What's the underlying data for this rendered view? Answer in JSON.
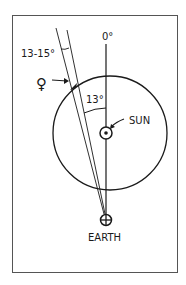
{
  "diagram": {
    "type": "astronomy-geometry-sketch",
    "labels": {
      "zero_degree": "0°",
      "sun_angle": "13°",
      "venus_range": "13-15°",
      "sun": "SUN",
      "earth": "EARTH"
    },
    "symbols": {
      "venus": "♀",
      "sun": "☉",
      "earth": "⊕"
    },
    "angles": {
      "sun_offset_deg": 13,
      "venus_range_deg": "13-15"
    },
    "colors": {
      "ink": "#1a1a1a",
      "frame": "#555555",
      "background": "#ffffff"
    }
  }
}
